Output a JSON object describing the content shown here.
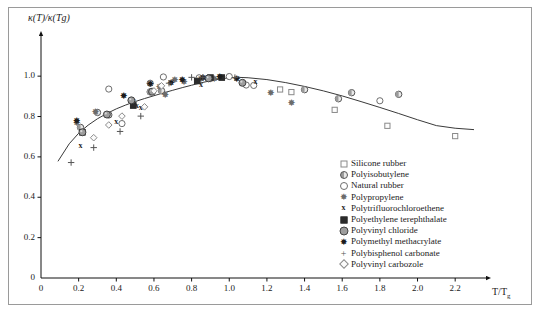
{
  "figure": {
    "ylabel": "κ(T)/κ(Tg)",
    "xlabel_main": "T/T",
    "xlabel_sub": "g"
  },
  "axes": {
    "x_ticks": [
      "0",
      "0.2",
      "0.4",
      "0.6",
      "0.8",
      "1.0",
      "1.2",
      "1.4",
      "1.6",
      "1.8",
      "2.0",
      "2.2"
    ],
    "y_ticks": [
      "0",
      "0.2",
      "0.4",
      "0.6",
      "0.8",
      "1.0"
    ]
  },
  "legend": {
    "items": [
      {
        "label": "Silicone rubber",
        "marker": "square-open",
        "color": "#8a8a8a"
      },
      {
        "label": "Polyisobutylene",
        "marker": "circle-half",
        "color": "#555555"
      },
      {
        "label": "Natural rubber",
        "marker": "circle-open",
        "color": "#6e6e6e"
      },
      {
        "label": "Polypropylene",
        "marker": "star-grey",
        "color": "#6b6b6b"
      },
      {
        "label": "Polytrifluorochloroethene",
        "marker": "x-bold",
        "color": "#1c1c1c"
      },
      {
        "label": "Polyethylene terephthalate",
        "marker": "square-filled",
        "color": "#2b2b2b"
      },
      {
        "label": "Polyvinyl chloride",
        "marker": "circle-grey",
        "color": "#9d9d9d"
      },
      {
        "label": "Polymethyl methacrylate",
        "marker": "star-dark",
        "color": "#1c1c1c"
      },
      {
        "label": "Polybisphenol carbonate",
        "marker": "plus",
        "color": "#555555"
      },
      {
        "label": "Polyvinyl carbozole",
        "marker": "diamond-open",
        "color": "#8a8a8a"
      }
    ]
  },
  "chart_data": {
    "type": "scatter",
    "title": "",
    "xlabel": "T/Tg",
    "ylabel": "κ(T)/κ(Tg)",
    "xlim": [
      0,
      2.3
    ],
    "ylim": [
      0,
      1.08
    ],
    "grid": false,
    "legend_position": "inside-lower-right",
    "fit_curve": {
      "name": "master curve",
      "color": "#3a3a3a",
      "x": [
        0.09,
        0.15,
        0.2,
        0.25,
        0.3,
        0.35,
        0.4,
        0.45,
        0.5,
        0.55,
        0.6,
        0.65,
        0.7,
        0.75,
        0.8,
        0.85,
        0.9,
        0.95,
        1.0,
        1.05,
        1.1,
        1.2,
        1.3,
        1.4,
        1.5,
        1.6,
        1.7,
        1.8,
        1.9,
        2.0,
        2.1,
        2.2,
        2.3
      ],
      "y": [
        0.578,
        0.665,
        0.717,
        0.757,
        0.789,
        0.815,
        0.838,
        0.857,
        0.874,
        0.889,
        0.903,
        0.917,
        0.93,
        0.943,
        0.955,
        0.967,
        0.977,
        0.986,
        0.992,
        0.994,
        0.992,
        0.983,
        0.968,
        0.949,
        0.927,
        0.902,
        0.874,
        0.845,
        0.815,
        0.784,
        0.755,
        0.742,
        0.735
      ]
    },
    "series": [
      {
        "name": "Silicone rubber",
        "marker": "square-open",
        "points": [
          [
            1.27,
            0.934
          ],
          [
            1.33,
            0.921
          ],
          [
            1.56,
            0.833
          ],
          [
            1.84,
            0.754
          ],
          [
            2.2,
            0.703
          ],
          [
            0.49,
            0.853
          ]
        ]
      },
      {
        "name": "Polyisobutylene",
        "marker": "circle-half",
        "points": [
          [
            0.21,
            0.746
          ],
          [
            0.36,
            0.808
          ],
          [
            0.58,
            0.922
          ],
          [
            0.64,
            0.928
          ],
          [
            1.4,
            0.933
          ],
          [
            1.65,
            0.918
          ],
          [
            1.9,
            0.91
          ],
          [
            1.58,
            0.888
          ],
          [
            0.3,
            0.82
          ]
        ]
      },
      {
        "name": "Natural rubber",
        "marker": "circle-open",
        "points": [
          [
            0.36,
            0.936
          ],
          [
            0.43,
            0.765
          ],
          [
            0.65,
            0.996
          ],
          [
            0.84,
            0.992
          ],
          [
            0.9,
            0.988
          ],
          [
            1.0,
            0.998
          ],
          [
            1.09,
            0.956
          ],
          [
            1.13,
            0.954
          ],
          [
            1.8,
            0.878
          ],
          [
            0.58,
            0.965
          ]
        ]
      },
      {
        "name": "Polypropylene",
        "marker": "star-grey",
        "points": [
          [
            0.19,
            0.77
          ],
          [
            0.29,
            0.824
          ],
          [
            0.49,
            0.875
          ],
          [
            0.63,
            0.95
          ],
          [
            0.71,
            0.983
          ],
          [
            0.76,
            0.972
          ],
          [
            0.85,
            0.988
          ],
          [
            0.92,
            0.988
          ],
          [
            1.22,
            0.918
          ],
          [
            1.33,
            0.868
          ],
          [
            0.66,
            0.911
          ]
        ]
      },
      {
        "name": "Polytrifluorochloroethene",
        "marker": "x-bold",
        "points": [
          [
            0.21,
            0.657
          ],
          [
            0.4,
            0.777
          ],
          [
            0.53,
            0.848
          ],
          [
            0.85,
            0.96
          ],
          [
            1.14,
            0.975
          ],
          [
            0.51,
            0.858
          ]
        ]
      },
      {
        "name": "Polyethylene terephthalate",
        "marker": "square-filled",
        "points": [
          [
            0.22,
            0.722
          ],
          [
            0.49,
            0.855
          ],
          [
            0.83,
            0.976
          ],
          [
            0.9,
            0.993
          ],
          [
            0.96,
            0.993
          ]
        ]
      },
      {
        "name": "Polyvinyl chloride",
        "marker": "circle-grey",
        "points": [
          [
            0.22,
            0.722
          ],
          [
            0.35,
            0.81
          ],
          [
            0.48,
            0.88
          ],
          [
            0.59,
            0.923
          ],
          [
            0.89,
            0.989
          ],
          [
            1.07,
            0.967
          ]
        ]
      },
      {
        "name": "Polymethyl methacrylate",
        "marker": "star-dark",
        "points": [
          [
            0.19,
            0.782
          ],
          [
            0.44,
            0.905
          ],
          [
            0.58,
            0.962
          ],
          [
            0.69,
            0.967
          ],
          [
            0.75,
            0.983
          ],
          [
            0.95,
            0.996
          ],
          [
            1.04,
            0.988
          ],
          [
            0.86,
            0.993
          ]
        ]
      },
      {
        "name": "Polybisphenol carbonate",
        "marker": "plus",
        "points": [
          [
            0.16,
            0.572
          ],
          [
            0.28,
            0.646
          ],
          [
            0.42,
            0.726
          ],
          [
            0.53,
            0.802
          ],
          [
            0.68,
            0.965
          ],
          [
            0.8,
            0.994
          ],
          [
            0.86,
            0.994
          ],
          [
            1.03,
            0.993
          ]
        ]
      },
      {
        "name": "Polyvinyl carbozole",
        "marker": "diamond-open",
        "points": [
          [
            0.28,
            0.695
          ],
          [
            0.36,
            0.758
          ],
          [
            0.43,
            0.802
          ],
          [
            0.55,
            0.848
          ],
          [
            0.6,
            0.927
          ],
          [
            0.64,
            0.952
          ]
        ]
      }
    ]
  }
}
